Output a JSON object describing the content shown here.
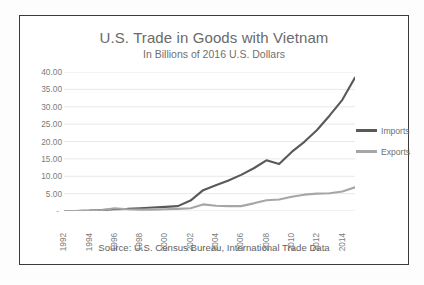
{
  "chart_title": "U.S. Trade in Goods with Vietnam",
  "chart_subtitle": "In Billions of 2016 U.S. Dollars",
  "source_note": "Source:  U.S. Census Bureau, International Trade Data",
  "legend": {
    "position": "right",
    "entries": [
      {
        "label": "Imports",
        "color": "#595959"
      },
      {
        "label": "Exports",
        "color": "#a6a6a6"
      }
    ]
  },
  "colors": {
    "imports": "#595959",
    "exports": "#a6a6a6",
    "gridline": "#e2e2e2",
    "axis_text": "#7b7b7b",
    "frame": "#3a3a3a"
  },
  "chart_data": {
    "type": "line",
    "title": "U.S. Trade in Goods with Vietnam",
    "subtitle": "In Billions of 2016 U.S. Dollars",
    "xlabel": "",
    "ylabel": "",
    "ylim": [
      0,
      40
    ],
    "ytick_labels": [
      "40.00",
      "35.00",
      "30.00",
      "25.00",
      "20.00",
      "15.00",
      "10.00",
      "5.00",
      "-"
    ],
    "ytick_values": [
      40,
      35,
      30,
      25,
      20,
      15,
      10,
      5,
      0
    ],
    "grid": true,
    "xlim": [
      1992,
      2015
    ],
    "xtick_labels": [
      "1992",
      "1994",
      "1996",
      "1998",
      "2000",
      "2002",
      "2004",
      "2006",
      "2008",
      "2010",
      "2012",
      "2014"
    ],
    "xtick_values": [
      1992,
      1994,
      1996,
      1998,
      2000,
      2002,
      2004,
      2006,
      2008,
      2010,
      2012,
      2014
    ],
    "x": [
      1992,
      1993,
      1994,
      1995,
      1996,
      1997,
      1998,
      1999,
      2000,
      2001,
      2002,
      2003,
      2004,
      2005,
      2006,
      2007,
      2008,
      2009,
      2010,
      2011,
      2012,
      2013,
      2014,
      2015
    ],
    "series": [
      {
        "name": "Imports",
        "color": "#595959",
        "values": [
          0.0,
          0.0,
          0.1,
          0.3,
          0.5,
          0.6,
          0.8,
          1.0,
          1.2,
          1.4,
          3.0,
          6.0,
          7.4,
          8.8,
          10.4,
          12.3,
          14.6,
          13.5,
          17.0,
          19.9,
          23.3,
          27.5,
          32.0,
          38.4
        ]
      },
      {
        "name": "Exports",
        "color": "#a6a6a6",
        "values": [
          0.0,
          0.0,
          0.1,
          0.3,
          0.8,
          0.5,
          0.4,
          0.4,
          0.5,
          0.6,
          0.8,
          1.9,
          1.5,
          1.4,
          1.4,
          2.2,
          3.1,
          3.3,
          4.1,
          4.7,
          5.0,
          5.1,
          5.6,
          6.8
        ]
      }
    ]
  }
}
